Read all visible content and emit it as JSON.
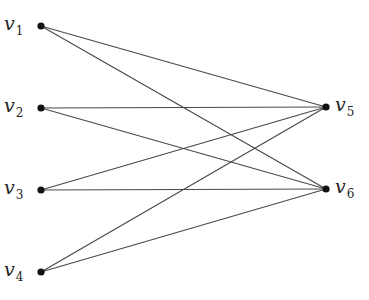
{
  "diagram": {
    "type": "bipartite-graph",
    "colors": {
      "edge": "#4a4a4a",
      "node": "#111111",
      "label": "#222222",
      "background": "#ffffff"
    },
    "nodes": [
      {
        "id": "v1",
        "base": "v",
        "sub": "1",
        "x": 41,
        "y": 26,
        "label_side": "left"
      },
      {
        "id": "v2",
        "base": "v",
        "sub": "2",
        "x": 41,
        "y": 108,
        "label_side": "left"
      },
      {
        "id": "v3",
        "base": "v",
        "sub": "3",
        "x": 41,
        "y": 190,
        "label_side": "left"
      },
      {
        "id": "v4",
        "base": "v",
        "sub": "4",
        "x": 41,
        "y": 272,
        "label_side": "left"
      },
      {
        "id": "v5",
        "base": "v",
        "sub": "5",
        "x": 326,
        "y": 107,
        "label_side": "right"
      },
      {
        "id": "v6",
        "base": "v",
        "sub": "6",
        "x": 326,
        "y": 189,
        "label_side": "right"
      }
    ],
    "edges": [
      [
        "v1",
        "v5"
      ],
      [
        "v1",
        "v6"
      ],
      [
        "v2",
        "v5"
      ],
      [
        "v2",
        "v6"
      ],
      [
        "v3",
        "v5"
      ],
      [
        "v3",
        "v6"
      ],
      [
        "v4",
        "v5"
      ],
      [
        "v4",
        "v6"
      ]
    ]
  }
}
